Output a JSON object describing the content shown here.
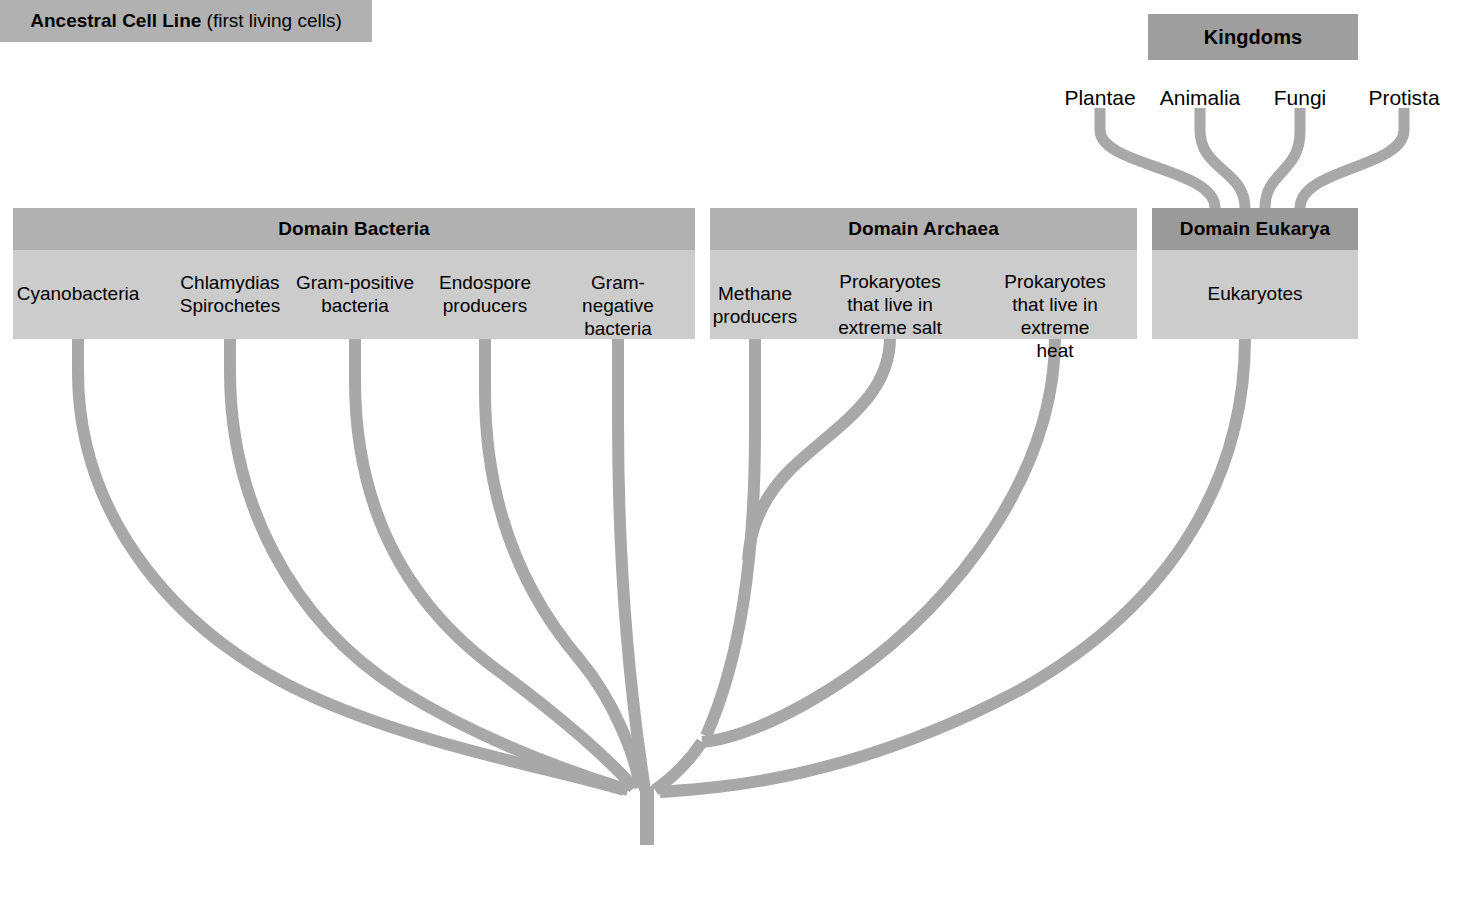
{
  "diagram": {
    "branch_color": "#a8a8a8",
    "box_header_color": "#b1b1b1",
    "box_header_dark_color": "#9a9a9a",
    "box_body_color": "#cccccc"
  },
  "kingdoms": {
    "title": "Kingdoms",
    "items": [
      {
        "label": "Plantae"
      },
      {
        "label": "Animalia"
      },
      {
        "label": "Fungi"
      },
      {
        "label": "Protista"
      }
    ]
  },
  "domains": [
    {
      "key": "bacteria",
      "title": "Domain Bacteria",
      "groups": [
        {
          "label": "Cyanobacteria"
        },
        {
          "label": "Chlamydias\nSpirochetes"
        },
        {
          "label": "Gram-positive\nbacteria"
        },
        {
          "label": "Endospore\nproducers"
        },
        {
          "label": "Gram-negative\nbacteria"
        }
      ]
    },
    {
      "key": "archaea",
      "title": "Domain Archaea",
      "groups": [
        {
          "label": "Methane\nproducers"
        },
        {
          "label": "Prokaryotes\nthat live in\nextreme salt"
        },
        {
          "label": "Prokaryotes\nthat live in\nextreme heat"
        }
      ]
    },
    {
      "key": "eukarya",
      "title": "Domain Eukarya",
      "groups": [
        {
          "label": "Eukaryotes"
        }
      ]
    }
  ],
  "root": {
    "bold_text": "Ancestral Cell Line",
    "rest_text": " (first living cells)"
  }
}
